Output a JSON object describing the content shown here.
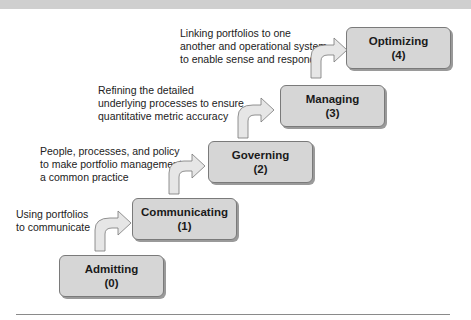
{
  "diagram": {
    "type": "staircase maturity model",
    "stages": [
      {
        "name": "Admitting",
        "level": "(0)",
        "description": []
      },
      {
        "name": "Communicating",
        "level": "(1)",
        "description": [
          "Using portfolios",
          "to communicate"
        ]
      },
      {
        "name": "Governing",
        "level": "(2)",
        "description": [
          "People, processes, and policy",
          "to make portfolio management",
          "a common practice"
        ]
      },
      {
        "name": "Managing",
        "level": "(3)",
        "description": [
          "Refining the detailed",
          "underlying processes to ensure",
          "quantitative metric accuracy"
        ]
      },
      {
        "name": "Optimizing",
        "level": "(4)",
        "description": [
          "Linking portfolios to one",
          "another and operational system",
          "to enable sense and respond"
        ]
      }
    ],
    "colors": {
      "box_fill": "#d6d6d6",
      "box_border": "#7a7a7a",
      "arrow_fill": "#e6e6e6",
      "text": "#1a1a1a"
    }
  }
}
